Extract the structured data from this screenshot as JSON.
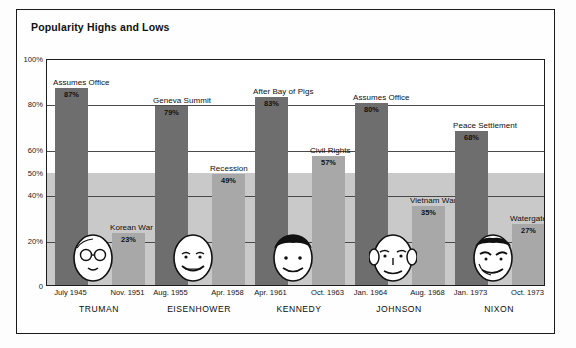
{
  "chart_title": "Popularity Highs and Lows",
  "axis": {
    "y_ticks": [
      "100%",
      "80%",
      "60%",
      "50%",
      "40%",
      "20%",
      "0"
    ],
    "y_tick_values": [
      100,
      80,
      60,
      50,
      40,
      20,
      0
    ],
    "ylim": [
      0,
      100
    ]
  },
  "colors": {
    "bar_high": "#6e6e6e",
    "bar_low": "#a8a8a8",
    "low_band": "#c9c9c9",
    "frame": "#1a1a1a",
    "text": "#111111"
  },
  "chart_data": {
    "type": "bar",
    "title": "Popularity Highs and Lows",
    "xlabel": "",
    "ylabel": "",
    "ylim": [
      0,
      100
    ],
    "grid": true,
    "legend": "none",
    "categories": [
      "TRUMAN",
      "EISENHOWER",
      "KENNEDY",
      "JOHNSON",
      "NIXON"
    ],
    "series": [
      {
        "name": "High",
        "values": [
          87,
          79,
          83,
          80,
          68
        ],
        "labels": [
          "Assumes Office",
          "Geneva Summit",
          "After Bay of Pigs",
          "Assumes Office",
          "Peace Settlement"
        ],
        "dates": [
          "July 1945",
          "Aug. 1955",
          "Apr. 1961",
          "Jan. 1964",
          "Jan. 1973"
        ],
        "value_labels": [
          "87%",
          "79%",
          "83%",
          "80%",
          "68%"
        ]
      },
      {
        "name": "Low",
        "values": [
          23,
          49,
          57,
          35,
          27
        ],
        "labels": [
          "Korean War",
          "Recession",
          "Civil Rights",
          "Vietnam War",
          "Watergate"
        ],
        "dates": [
          "Nov. 1951",
          "Apr. 1958",
          "Oct. 1963",
          "Aug. 1968",
          "Oct. 1973"
        ],
        "value_labels": [
          "23%",
          "49%",
          "57%",
          "35%",
          "27%"
        ]
      }
    ],
    "presidents": [
      {
        "name": "TRUMAN",
        "high": {
          "label": "Assumes Office",
          "value": 87,
          "value_label": "87%",
          "date": "July 1945"
        },
        "low": {
          "label": "Korean War",
          "value": 23,
          "value_label": "23%",
          "date": "Nov. 1951"
        }
      },
      {
        "name": "EISENHOWER",
        "high": {
          "label": "Geneva Summit",
          "value": 79,
          "value_label": "79%",
          "date": "Aug. 1955"
        },
        "low": {
          "label": "Recession",
          "value": 49,
          "value_label": "49%",
          "date": "Apr. 1958"
        }
      },
      {
        "name": "KENNEDY",
        "high": {
          "label": "After Bay of Pigs",
          "value": 83,
          "value_label": "83%",
          "date": "Apr. 1961"
        },
        "low": {
          "label": "Civil Rights",
          "value": 57,
          "value_label": "57%",
          "date": "Oct. 1963"
        }
      },
      {
        "name": "JOHNSON",
        "high": {
          "label": "Assumes Office",
          "value": 80,
          "value_label": "80%",
          "date": "Jan. 1964"
        },
        "low": {
          "label": "Vietnam War",
          "value": 35,
          "value_label": "35%",
          "date": "Aug. 1968"
        }
      },
      {
        "name": "NIXON",
        "high": {
          "label": "Peace Settlement",
          "value": 68,
          "value_label": "68%",
          "date": "Jan. 1973"
        },
        "low": {
          "label": "Watergate",
          "value": 27,
          "value_label": "27%",
          "date": "Oct. 1973"
        }
      }
    ]
  }
}
